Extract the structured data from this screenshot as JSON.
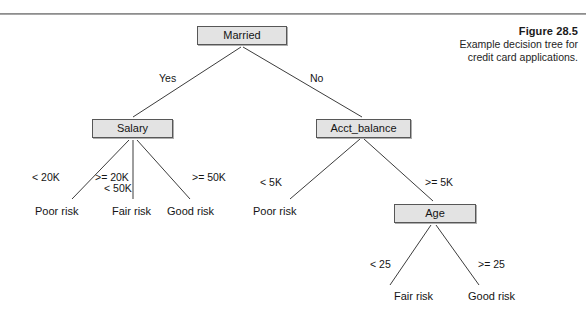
{
  "figure": {
    "title": "Figure 28.5",
    "caption_line_1": "Example decision tree for",
    "caption_line_2": "credit card applications."
  },
  "colors": {
    "node_fill": "#e3e3e3",
    "node_border": "#575757",
    "edge": "#3c3c3c",
    "text": "#141414",
    "rule": "#8d8d8d"
  },
  "chart_data": {
    "type": "diagram",
    "diagram_type": "decision-tree",
    "title": "Example decision tree for credit card applications.",
    "nodes": [
      {
        "id": "married",
        "label": "Married",
        "kind": "decision",
        "x": 197,
        "y": 26,
        "w": 90,
        "h": 19
      },
      {
        "id": "salary",
        "label": "Salary",
        "kind": "decision",
        "x": 92,
        "y": 119,
        "w": 81,
        "h": 19
      },
      {
        "id": "acct_balance",
        "label": "Acct_balance",
        "kind": "decision",
        "x": 316,
        "y": 119,
        "w": 95,
        "h": 19
      },
      {
        "id": "age",
        "label": "Age",
        "kind": "decision",
        "x": 394,
        "y": 204,
        "w": 82,
        "h": 19
      }
    ],
    "leaves": [
      {
        "id": "leaf_poor_1",
        "label": "Poor risk",
        "x": 35,
        "y": 205
      },
      {
        "id": "leaf_fair_1",
        "label": "Fair risk",
        "x": 112,
        "y": 205
      },
      {
        "id": "leaf_good_1",
        "label": "Good risk",
        "x": 167,
        "y": 205
      },
      {
        "id": "leaf_poor_2",
        "label": "Poor risk",
        "x": 253,
        "y": 205
      },
      {
        "id": "leaf_fair_2",
        "label": "Fair risk",
        "x": 394,
        "y": 290
      },
      {
        "id": "leaf_good_2",
        "label": "Good risk",
        "x": 468,
        "y": 290
      }
    ],
    "edges": [
      {
        "from": "married",
        "to": "salary",
        "label": "Yes",
        "label_x": 159,
        "label_y": 72
      },
      {
        "from": "married",
        "to": "acct_balance",
        "label": "No",
        "label_x": 310,
        "label_y": 72
      },
      {
        "from": "salary",
        "to": "leaf_poor_1",
        "label": "< 20K",
        "label_x": 32,
        "label_y": 171
      },
      {
        "from": "salary",
        "to": "leaf_fair_1",
        "label": ">= 20K",
        "label_x": 95,
        "label_y": 171
      },
      {
        "from": "salary",
        "to": "leaf_fair_1",
        "label": "< 50K",
        "label_x": 104,
        "label_y": 182
      },
      {
        "from": "salary",
        "to": "leaf_good_1",
        "label": ">= 50K",
        "label_x": 192,
        "label_y": 171
      },
      {
        "from": "acct_balance",
        "to": "leaf_poor_2",
        "label": "< 5K",
        "label_x": 260,
        "label_y": 176
      },
      {
        "from": "acct_balance",
        "to": "age",
        "label": ">= 5K",
        "label_x": 425,
        "label_y": 176
      },
      {
        "from": "age",
        "to": "leaf_fair_2",
        "label": "< 25",
        "label_x": 370,
        "label_y": 258
      },
      {
        "from": "age",
        "to": "leaf_good_2",
        "label": ">= 25",
        "label_x": 478,
        "label_y": 258
      }
    ],
    "links_geometry": [
      {
        "name": "married-to-salary",
        "x1": 241,
        "y1": 47,
        "x2": 133,
        "y2": 117
      },
      {
        "name": "married-to-acct",
        "x1": 243,
        "y1": 47,
        "x2": 362,
        "y2": 117
      },
      {
        "name": "salary-to-poor",
        "x1": 129,
        "y1": 140,
        "x2": 72,
        "y2": 199
      },
      {
        "name": "salary-to-fair",
        "x1": 133,
        "y1": 140,
        "x2": 133,
        "y2": 199
      },
      {
        "name": "salary-to-good",
        "x1": 137,
        "y1": 140,
        "x2": 190,
        "y2": 199
      },
      {
        "name": "acct-to-poor",
        "x1": 360,
        "y1": 139,
        "x2": 290,
        "y2": 199
      },
      {
        "name": "acct-to-age",
        "x1": 364,
        "y1": 139,
        "x2": 433,
        "y2": 201
      },
      {
        "name": "age-to-fair",
        "x1": 431,
        "y1": 225,
        "x2": 390,
        "y2": 285
      },
      {
        "name": "age-to-good",
        "x1": 436,
        "y1": 225,
        "x2": 479,
        "y2": 285
      }
    ]
  }
}
